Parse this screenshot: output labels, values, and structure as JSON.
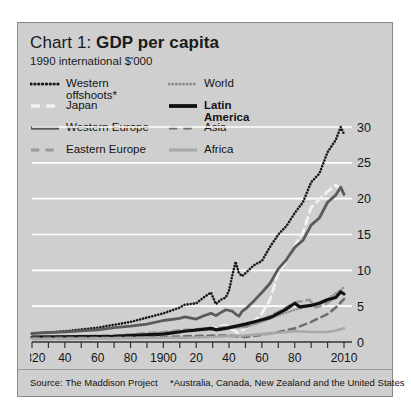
{
  "chart_data": {
    "type": "line",
    "title": "Chart 1: GDP per capita",
    "title_plain": "Chart 1: ",
    "title_bold": "GDP per capita",
    "subtitle": "1990 international $'000",
    "xlabel": "",
    "ylabel": "",
    "ylim": [
      0,
      30
    ],
    "xlim": [
      1820,
      2010
    ],
    "yticks": [
      "30",
      "25",
      "20",
      "15",
      "10",
      "5",
      "0"
    ],
    "ytick_values": [
      30,
      25,
      20,
      15,
      10,
      5,
      0
    ],
    "xticks": [
      "1820",
      "40",
      "60",
      "80",
      "1900",
      "20",
      "40",
      "60",
      "80",
      "2010"
    ],
    "xtick_values": [
      1820,
      1840,
      1860,
      1880,
      1900,
      1920,
      1940,
      1960,
      1980,
      2010
    ],
    "grid": "horizontal-white",
    "legend_position": "top-inside-two-columns",
    "series": [
      {
        "name": "Western offshoots*",
        "label": "Western\noffshoots*",
        "style": "dotted",
        "color": "#1a1a1a",
        "width": 2.6,
        "column": "left",
        "x": [
          1820,
          1840,
          1860,
          1870,
          1880,
          1890,
          1900,
          1910,
          1913,
          1920,
          1925,
          1929,
          1932,
          1935,
          1938,
          1940,
          1942,
          1944,
          1946,
          1948,
          1950,
          1955,
          1960,
          1965,
          1970,
          1975,
          1980,
          1985,
          1990,
          1995,
          2000,
          2005,
          2008,
          2010
        ],
        "y": [
          1.2,
          1.5,
          2.0,
          2.4,
          2.8,
          3.4,
          4.0,
          4.8,
          5.2,
          5.4,
          6.3,
          6.9,
          5.3,
          5.9,
          6.2,
          7.2,
          9.3,
          11.2,
          9.6,
          9.2,
          9.6,
          10.7,
          11.3,
          13.3,
          15.0,
          16.2,
          18.0,
          19.5,
          22.3,
          23.5,
          26.5,
          28.2,
          30.0,
          29.0
        ]
      },
      {
        "name": "Japan",
        "label": "Japan",
        "style": "dashed",
        "color": "#f2f2f2",
        "width": 2.8,
        "column": "left",
        "x": [
          1820,
          1850,
          1870,
          1890,
          1900,
          1913,
          1920,
          1930,
          1938,
          1945,
          1950,
          1955,
          1960,
          1965,
          1970,
          1975,
          1980,
          1985,
          1990,
          1995,
          2000,
          2005,
          2010
        ],
        "y": [
          0.7,
          0.7,
          0.8,
          1.0,
          1.2,
          1.4,
          1.7,
          1.9,
          2.4,
          1.3,
          1.9,
          2.8,
          4.0,
          5.9,
          9.7,
          11.3,
          13.4,
          15.3,
          18.8,
          19.9,
          21.0,
          21.9,
          21.0
        ]
      },
      {
        "name": "Western Europe",
        "label": "Western Europe",
        "style": "solid",
        "color": "#5a5a5a",
        "width": 2.8,
        "column": "left",
        "x": [
          1820,
          1840,
          1860,
          1870,
          1880,
          1890,
          1900,
          1910,
          1913,
          1920,
          1925,
          1929,
          1932,
          1935,
          1938,
          1942,
          1944,
          1946,
          1948,
          1950,
          1955,
          1960,
          1965,
          1970,
          1975,
          1980,
          1985,
          1990,
          1995,
          2000,
          2005,
          2008,
          2010
        ],
        "y": [
          1.2,
          1.4,
          1.7,
          2.0,
          2.2,
          2.5,
          3.0,
          3.3,
          3.5,
          3.2,
          3.7,
          4.0,
          3.7,
          4.1,
          4.5,
          4.3,
          3.9,
          3.6,
          4.3,
          4.6,
          5.7,
          6.9,
          8.2,
          10.2,
          11.5,
          13.2,
          14.2,
          16.3,
          17.3,
          19.5,
          20.5,
          21.6,
          20.6
        ]
      },
      {
        "name": "Eastern Europe",
        "label": "Eastern Europe",
        "style": "dashed",
        "color": "#9a9a9a",
        "width": 2.6,
        "column": "left",
        "x": [
          1820,
          1870,
          1900,
          1913,
          1930,
          1938,
          1950,
          1960,
          1970,
          1980,
          1989,
          1993,
          2000,
          2005,
          2010
        ],
        "y": [
          0.7,
          0.9,
          1.4,
          1.7,
          1.9,
          2.1,
          2.1,
          3.1,
          4.2,
          5.5,
          5.9,
          4.8,
          5.4,
          6.4,
          7.2
        ]
      },
      {
        "name": "World",
        "label": "World",
        "style": "dotted",
        "color": "#8f8f8f",
        "width": 2.4,
        "column": "right",
        "x": [
          1820,
          1870,
          1900,
          1913,
          1930,
          1938,
          1950,
          1960,
          1970,
          1980,
          1990,
          2000,
          2005,
          2010
        ],
        "y": [
          0.7,
          0.9,
          1.3,
          1.5,
          1.7,
          1.9,
          2.1,
          2.8,
          3.7,
          4.5,
          5.1,
          6.0,
          6.8,
          7.6
        ]
      },
      {
        "name": "Latin America",
        "label": "Latin\nAmerica",
        "style": "solid",
        "color": "#111111",
        "width": 3.2,
        "column": "right",
        "x": [
          1820,
          1870,
          1900,
          1913,
          1929,
          1932,
          1938,
          1950,
          1955,
          1960,
          1965,
          1970,
          1975,
          1980,
          1983,
          1990,
          1995,
          2000,
          2005,
          2008,
          2010
        ],
        "y": [
          0.7,
          0.8,
          1.1,
          1.5,
          1.9,
          1.7,
          1.9,
          2.5,
          2.8,
          3.1,
          3.4,
          4.0,
          4.6,
          5.4,
          4.9,
          5.1,
          5.4,
          5.9,
          6.2,
          7.0,
          6.7
        ]
      },
      {
        "name": "Asia",
        "label": "Asia",
        "style": "dashed",
        "color": "#6e6e6e",
        "width": 2.6,
        "column": "right",
        "x": [
          1820,
          1870,
          1900,
          1913,
          1930,
          1938,
          1950,
          1960,
          1970,
          1980,
          1990,
          2000,
          2005,
          2010
        ],
        "y": [
          0.6,
          0.6,
          0.7,
          0.8,
          0.9,
          0.9,
          0.7,
          1.0,
          1.4,
          1.9,
          2.8,
          3.9,
          4.8,
          6.0
        ]
      },
      {
        "name": "Africa",
        "label": "Africa",
        "style": "solid",
        "color": "#a8a8a8",
        "width": 2.6,
        "column": "right",
        "x": [
          1820,
          1870,
          1900,
          1913,
          1930,
          1938,
          1950,
          1960,
          1970,
          1980,
          1990,
          2000,
          2005,
          2010
        ],
        "y": [
          0.4,
          0.5,
          0.6,
          0.6,
          0.7,
          0.8,
          0.9,
          1.1,
          1.3,
          1.5,
          1.4,
          1.4,
          1.6,
          1.9
        ]
      }
    ]
  },
  "footer": {
    "source": "Source: The Maddison Project",
    "note": "*Australia, Canada, New Zealand and the United States"
  },
  "colors": {
    "panel_background": "#cfcfcf",
    "gridline": "#ffffff",
    "axis": "#333333",
    "text": "#141414"
  }
}
